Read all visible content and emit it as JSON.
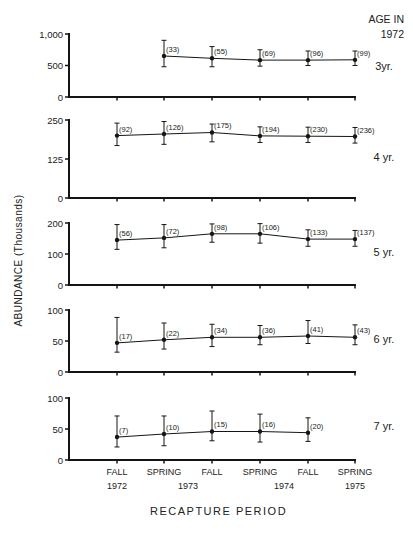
{
  "chart_data": {
    "type": "line",
    "title": "",
    "xlabel": "RECAPTURE PERIOD",
    "ylabel": "ABUNDANCE (Thousands)",
    "legend_header": "AGE IN 1972",
    "categories": [
      "FALL 1972",
      "SPRING 1973",
      "FALL 1973",
      "SPRING 1974",
      "FALL 1974",
      "SPRING 1975"
    ],
    "x_tick_labels": [
      {
        "line1": "FALL",
        "line2": "1972"
      },
      {
        "line1": "SPRING",
        "line2": ""
      },
      {
        "line1": "FALL",
        "line2": ""
      },
      {
        "line1": "SPRING",
        "line2": ""
      },
      {
        "line1": "FALL",
        "line2": ""
      },
      {
        "line1": "SPRING",
        "line2": "1975"
      }
    ],
    "x_year_labels": [
      {
        "text": "1973",
        "between": [
          1,
          2
        ]
      },
      {
        "text": "1974",
        "between": [
          3,
          4
        ]
      }
    ],
    "panels": [
      {
        "name": "3 yr.",
        "label": "3yr.",
        "ylim": [
          0,
          1000
        ],
        "yticks": [
          0,
          500,
          1000
        ],
        "ytick_labels": [
          "0",
          "500",
          "1,000"
        ],
        "points": [
          {
            "x": 1,
            "value": 650,
            "low": 480,
            "high": 900,
            "n": "(33)"
          },
          {
            "x": 2,
            "value": 615,
            "low": 480,
            "high": 800,
            "n": "(55)"
          },
          {
            "x": 3,
            "value": 585,
            "low": 490,
            "high": 750,
            "n": "(69)"
          },
          {
            "x": 4,
            "value": 585,
            "low": 500,
            "high": 730,
            "n": "(96)"
          },
          {
            "x": 5,
            "value": 590,
            "low": 500,
            "high": 730,
            "n": "(99)"
          }
        ]
      },
      {
        "name": "4 yr.",
        "label": "4 yr.",
        "ylim": [
          0,
          250
        ],
        "yticks": [
          0,
          125,
          250
        ],
        "ytick_labels": [
          "0",
          "125",
          "250"
        ],
        "points": [
          {
            "x": 0,
            "value": 200,
            "low": 168,
            "high": 240,
            "n": "(92)"
          },
          {
            "x": 1,
            "value": 205,
            "low": 172,
            "high": 245,
            "n": "(126)"
          },
          {
            "x": 2,
            "value": 210,
            "low": 180,
            "high": 237,
            "n": "(175)"
          },
          {
            "x": 3,
            "value": 199,
            "low": 178,
            "high": 228,
            "n": "(194)"
          },
          {
            "x": 4,
            "value": 198,
            "low": 178,
            "high": 227,
            "n": "(230)"
          },
          {
            "x": 5,
            "value": 197,
            "low": 176,
            "high": 226,
            "n": "(236)"
          }
        ]
      },
      {
        "name": "5 yr.",
        "label": "5 yr.",
        "ylim": [
          0,
          200
        ],
        "yticks": [
          0,
          100,
          200
        ],
        "ytick_labels": [
          "0",
          "100",
          "200"
        ],
        "points": [
          {
            "x": 0,
            "value": 145,
            "low": 115,
            "high": 195,
            "n": "(56)"
          },
          {
            "x": 1,
            "value": 152,
            "low": 120,
            "high": 195,
            "n": "(72)"
          },
          {
            "x": 2,
            "value": 165,
            "low": 138,
            "high": 197,
            "n": "(98)"
          },
          {
            "x": 3,
            "value": 165,
            "low": 135,
            "high": 198,
            "n": "(106)"
          },
          {
            "x": 4,
            "value": 148,
            "low": 125,
            "high": 178,
            "n": "(133)"
          },
          {
            "x": 5,
            "value": 148,
            "low": 125,
            "high": 176,
            "n": "(137)"
          }
        ]
      },
      {
        "name": "6 yr.",
        "label": "6 yr.",
        "ylim": [
          0,
          100
        ],
        "yticks": [
          0,
          50,
          100
        ],
        "ytick_labels": [
          "0",
          "50",
          "100"
        ],
        "points": [
          {
            "x": 0,
            "value": 47,
            "low": 32,
            "high": 88,
            "n": "(17)"
          },
          {
            "x": 1,
            "value": 52,
            "low": 37,
            "high": 79,
            "n": "(22)"
          },
          {
            "x": 2,
            "value": 56,
            "low": 41,
            "high": 77,
            "n": "(34)"
          },
          {
            "x": 3,
            "value": 56,
            "low": 44,
            "high": 75,
            "n": "(36)"
          },
          {
            "x": 4,
            "value": 58,
            "low": 46,
            "high": 83,
            "n": "(41)"
          },
          {
            "x": 5,
            "value": 56,
            "low": 44,
            "high": 76,
            "n": "(43)"
          }
        ]
      },
      {
        "name": "7 yr.",
        "label": "7 yr.",
        "ylim": [
          0,
          100
        ],
        "yticks": [
          0,
          50,
          100
        ],
        "ytick_labels": [
          "0",
          "50",
          "100"
        ],
        "points": [
          {
            "x": 0,
            "value": 37,
            "low": 21,
            "high": 71,
            "n": "(7)"
          },
          {
            "x": 1,
            "value": 42,
            "low": 23,
            "high": 71,
            "n": "(10)"
          },
          {
            "x": 2,
            "value": 46,
            "low": 31,
            "high": 79,
            "n": "(15)"
          },
          {
            "x": 3,
            "value": 46,
            "low": 29,
            "high": 74,
            "n": "(16)"
          },
          {
            "x": 4,
            "value": 44,
            "low": 30,
            "high": 68,
            "n": "(20)"
          }
        ]
      }
    ],
    "grid": false,
    "legend_position": "right"
  },
  "labels": {
    "y_axis": "ABUNDANCE  (Thousands)",
    "x_axis": "RECAPTURE   PERIOD",
    "age_head_line1": "AGE IN",
    "age_head_line2": "1972"
  }
}
